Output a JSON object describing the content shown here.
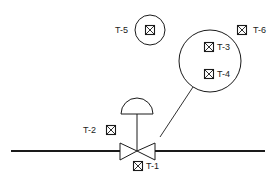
{
  "diagram": {
    "type": "piping-instrumentation",
    "line_color": "#1a1a1a",
    "background": "#ffffff",
    "pipe": {
      "label": ""
    },
    "valve": {
      "type": "control-valve",
      "actuator": "diaphragm"
    },
    "tags": [
      {
        "id": "T-1",
        "label": "T-1",
        "position": "below-valve"
      },
      {
        "id": "T-2",
        "label": "T-2",
        "position": "left-of-valve"
      },
      {
        "id": "T-3",
        "label": "T-3",
        "position": "large-circle-upper"
      },
      {
        "id": "T-4",
        "label": "T-4",
        "position": "large-circle-lower"
      },
      {
        "id": "T-5",
        "label": "T-5",
        "position": "small-circle"
      },
      {
        "id": "T-6",
        "label": "T-6",
        "position": "top-right"
      }
    ]
  }
}
